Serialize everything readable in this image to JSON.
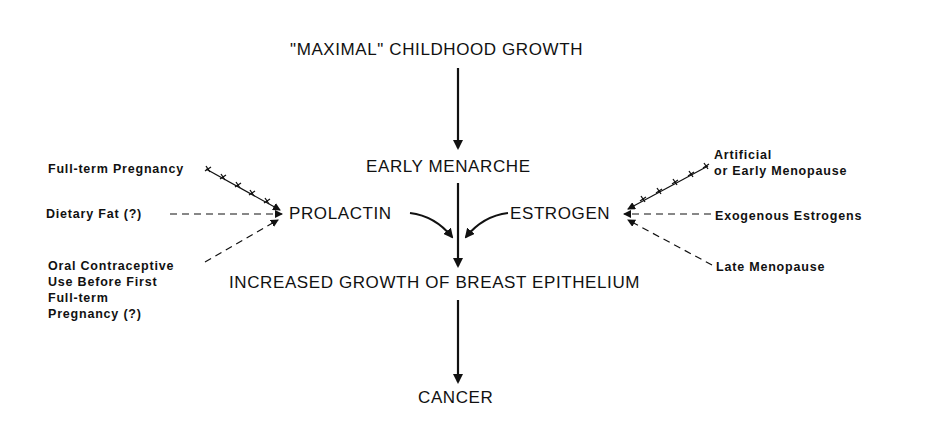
{
  "diagram": {
    "nodes": {
      "top": "\"MAXIMAL\" CHILDHOOD GROWTH",
      "menarche": "EARLY MENARCHE",
      "prolactin": "PROLACTIN",
      "estrogen": "ESTROGEN",
      "growth": "INCREASED GROWTH OF BREAST EPITHELIUM",
      "cancer": "CANCER"
    },
    "left_factors": {
      "pregnancy": "Full-term Pregnancy",
      "fat": "Dietary Fat (?)",
      "oc_line1": "Oral Contraceptive",
      "oc_line2": "Use Before First",
      "oc_line3": "Full-term",
      "oc_line4": "Pregnancy (?)"
    },
    "right_factors": {
      "artificial_line1": "Artificial",
      "artificial_line2": "or Early Menopause",
      "exogenous": "Exogenous Estrogens",
      "late": "Late Menopause"
    },
    "legend_semantics": {
      "crossed_line": "inhibitory influence (+ + + +)",
      "dashed_line": "promoting influence (- - - -)",
      "solid_arrow": "causal pathway"
    }
  }
}
